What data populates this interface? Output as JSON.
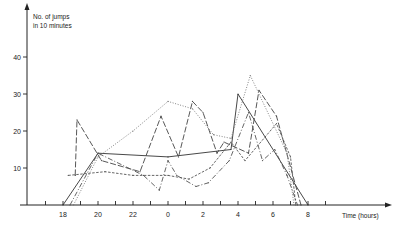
{
  "chart_data": {
    "type": "line",
    "title": "",
    "ylabel": "No. of jumps in 10 minutes",
    "ylabel_lines": [
      "No. of jumps",
      "in 10 minutes"
    ],
    "xlabel": "Time (hours)",
    "ylim": [
      0,
      45
    ],
    "xlim": [
      17,
      34
    ],
    "y_ticks": [
      10,
      20,
      30,
      40
    ],
    "y_tick_labels": [
      "10",
      "20",
      "30",
      "40"
    ],
    "x_ticks": [
      18,
      20,
      22,
      24,
      26,
      28,
      30,
      32
    ],
    "x_tick_labels": [
      "18",
      "20",
      "22",
      "0",
      "2",
      "4",
      "6",
      "8"
    ],
    "x_minor_ticks": [
      17,
      19,
      21,
      23,
      25,
      27,
      29,
      31,
      33
    ],
    "grid": false,
    "legend": "none",
    "x_note": "x values are hours on a continuous clock from 18:00 (18) through midnight (24) to 08:00 (32)",
    "series": [
      {
        "name": "series-solid",
        "style": "solid",
        "color": "#333333",
        "x": [
          18.0,
          20.0,
          24.0,
          27.6,
          28.0,
          32.0
        ],
        "y": [
          0,
          14,
          13,
          15,
          30,
          0
        ]
      },
      {
        "name": "series-long-dash",
        "style": "long-dash",
        "color": "#444444",
        "x": [
          18.7,
          18.8,
          20.2,
          22.4,
          23.6,
          24.6,
          25.4,
          26.0,
          26.8,
          27.2,
          28.6,
          29.2,
          30.2,
          31.6
        ],
        "y": [
          8,
          23,
          12,
          9,
          24,
          13,
          28,
          25,
          14,
          17,
          14,
          31,
          24,
          0
        ]
      },
      {
        "name": "series-dash-dot",
        "style": "dash-dot",
        "color": "#555555",
        "x": [
          18.4,
          20.0,
          22.6,
          23.5,
          24.0,
          24.5,
          25.6,
          26.3,
          27.5,
          28.6,
          29.4,
          30.1,
          30.8,
          31.4
        ],
        "y": [
          0,
          14,
          8,
          4,
          12,
          8,
          5,
          6,
          12,
          25,
          12,
          15,
          8,
          0
        ]
      },
      {
        "name": "series-dotted",
        "style": "dotted",
        "color": "#777777",
        "x": [
          18.6,
          20.0,
          22.0,
          24.0,
          25.4,
          26.6,
          27.6,
          28.7,
          30.8,
          31.2
        ],
        "y": [
          0,
          13,
          20,
          28,
          26,
          19,
          18,
          35,
          14,
          0
        ]
      },
      {
        "name": "series-short-dash",
        "style": "short-dash",
        "color": "#555555",
        "x": [
          18.3,
          20.4,
          22.0,
          24.0,
          25.2,
          26.4,
          27.6,
          28.4,
          30.2,
          31.0,
          31.3
        ],
        "y": [
          8,
          9,
          8,
          8,
          7,
          10,
          17,
          12,
          22,
          13,
          0
        ]
      }
    ]
  }
}
